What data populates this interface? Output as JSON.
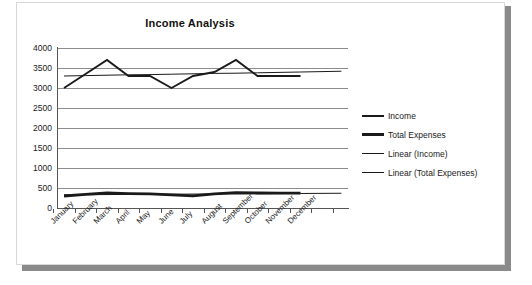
{
  "chart_data": {
    "type": "line",
    "title": "Income Analysis",
    "xlabel": "",
    "ylabel": "",
    "ylim": [
      0,
      4000
    ],
    "ytick_step": 500,
    "yticks": [
      "4000",
      "3500",
      "3000",
      "2500",
      "2000",
      "1500",
      "1000",
      "500",
      "0"
    ],
    "grid": true,
    "legend_position": "right",
    "categories": [
      "January",
      "February",
      "March",
      "April",
      "May",
      "June",
      "July",
      "August",
      "September",
      "October",
      "November",
      "December"
    ],
    "series": [
      {
        "name": "Income",
        "values": [
          3000,
          3350,
          3700,
          3300,
          3300,
          3000,
          3300,
          3400,
          3700,
          3300,
          3300,
          3300
        ]
      },
      {
        "name": "Total Expenses",
        "values": [
          300,
          340,
          375,
          360,
          355,
          330,
          305,
          355,
          385,
          375,
          370,
          370
        ]
      },
      {
        "name": "Linear (Income)",
        "trend": true,
        "values": [
          3300,
          3310,
          3320,
          3330,
          3335,
          3345,
          3355,
          3365,
          3370,
          3380,
          3390,
          3400
        ]
      },
      {
        "name": "Linear (Total Expenses)",
        "trend": true,
        "values": [
          330,
          333,
          336,
          339,
          342,
          345,
          348,
          351,
          354,
          357,
          360,
          363
        ]
      }
    ],
    "colors": {
      "income": "#1a1a1a",
      "total_expenses": "#111111",
      "linear_income": "#1a1a1a",
      "linear_total_expenses": "#1a1a1a",
      "gridline": "#8c8c8c",
      "axis": "#555555",
      "frame_shadow": "#8a8a8a",
      "background": "#ffffff"
    }
  },
  "legend": {
    "items": [
      {
        "label": "Income"
      },
      {
        "label": "Total Expenses"
      },
      {
        "label": "Linear (Income)"
      },
      {
        "label": "Linear (Total Expenses)"
      }
    ]
  }
}
